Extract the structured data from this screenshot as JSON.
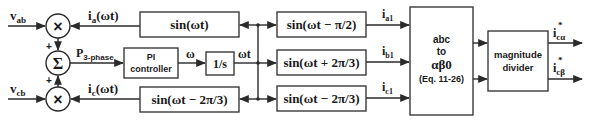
{
  "diagram": {
    "inputs": {
      "vab": {
        "main": "v",
        "sub": "ab"
      },
      "vcb": {
        "main": "v",
        "sub": "cb"
      }
    },
    "operators": {
      "mult_top": "×",
      "sum": "Σ",
      "mult_bottom": "×",
      "plus_top": "+",
      "plus_bottom": "+"
    },
    "signals": {
      "ia": {
        "main": "i",
        "sub": "a",
        "suffix": "(ωt)"
      },
      "ic": {
        "main": "i",
        "sub": "c",
        "suffix": "(ωt)"
      },
      "p3": {
        "main": "P",
        "sub": "3-phase"
      },
      "omega": "ω",
      "omega_t": "ωt",
      "ia1": {
        "main": "i",
        "sub": "a1"
      },
      "ib1": {
        "main": "i",
        "sub": "b1"
      },
      "ic1": {
        "main": "i",
        "sub": "c1"
      },
      "out_alpha": {
        "main": "i",
        "sup": "*",
        "sub": "cα"
      },
      "out_beta": {
        "main": "i",
        "sup": "*",
        "sub": "cβ"
      }
    },
    "blocks": {
      "sin_wt": "sin(ωt)",
      "sin_wt_m2pi3_left": "sin(ωt − 2π/3)",
      "pi_controller": {
        "line1": "PI",
        "line2": "controller"
      },
      "integrator": "1/s",
      "sin_wt_mpi2": "sin(ωt − π/2)",
      "sin_wt_p2pi3": "sin(ωt + 2π/3)",
      "sin_wt_m2pi3_right": "sin(ωt − 2π/3)",
      "abc_transform": {
        "line1": "abc",
        "line2": "to",
        "line3": "αβ0",
        "line4": "(Eq. 11-26)"
      },
      "magnitude_divider": {
        "line1": "magnitude",
        "line2": "divider"
      }
    }
  }
}
